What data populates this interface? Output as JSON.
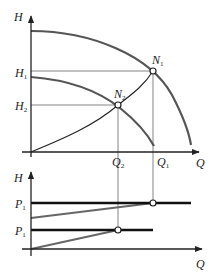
{
  "diagram": {
    "top_panel": {
      "y_axis_label": "H",
      "x_axis_label": "Q",
      "h_labels": [
        {
          "main": "H",
          "sub": "1"
        },
        {
          "main": "H",
          "sub": "2"
        }
      ],
      "q_labels": [
        {
          "main": "Q",
          "sub": "2"
        },
        {
          "main": "Q",
          "sub": "1"
        }
      ],
      "points": [
        {
          "main": "N",
          "sub": "1"
        },
        {
          "main": "N",
          "sub": "2"
        }
      ],
      "curves": [
        "pump-curve-high-speed",
        "pump-curve-low-speed",
        "system-curve"
      ]
    },
    "bottom_panel": {
      "y_axis_label": "H",
      "x_axis_label": "Q",
      "p_labels": [
        {
          "main": "P",
          "sub": "1"
        },
        {
          "main": "P",
          "sub": "1"
        }
      ]
    },
    "colors": {
      "axis": "#222222",
      "pump_curve": "#555555",
      "guide_line": "#666666",
      "power_line": "#111111",
      "power_slope": "#666666"
    }
  }
}
